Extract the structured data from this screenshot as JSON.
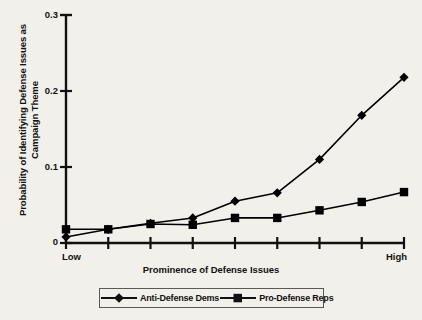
{
  "chart_data": {
    "type": "line",
    "title": "",
    "subtitle": "",
    "xlabel": "Prominence of Defense Issues",
    "ylabel": "Probability of Identifying Defense Issues as Campaign Theme",
    "ylabel_line1": "Probability of Identifying Defense Issues as",
    "ylabel_line2": "Campaign Theme",
    "x": [
      1,
      2,
      3,
      4,
      5,
      6,
      7,
      8,
      9
    ],
    "x_tick_labels": [
      "Low",
      "",
      "",
      "",
      "",
      "",
      "",
      "",
      "High"
    ],
    "x_axis_low_label": "Low",
    "x_axis_high_label": "High",
    "y_ticks": [
      0,
      0.1,
      0.2,
      0.3
    ],
    "y_tick_labels": [
      "0",
      "0.1",
      "0.2",
      "0.3"
    ],
    "ylim": [
      0,
      0.3
    ],
    "xlim": [
      1,
      9
    ],
    "grid": false,
    "legend_position": "bottom",
    "series": [
      {
        "name": "Anti-Defense Dems",
        "marker": "diamond",
        "color": "#000000",
        "values": [
          0.008,
          0.018,
          0.026,
          0.033,
          0.055,
          0.066,
          0.11,
          0.168,
          0.218
        ]
      },
      {
        "name": "Pro-Defense Reps",
        "marker": "square",
        "color": "#000000",
        "values": [
          0.018,
          0.018,
          0.025,
          0.024,
          0.033,
          0.033,
          0.043,
          0.054,
          0.067
        ]
      }
    ]
  },
  "legend": {
    "entries": [
      {
        "label": "Anti-Defense Dems",
        "marker": "diamond"
      },
      {
        "label": "Pro-Defense Reps",
        "marker": "square"
      }
    ]
  },
  "axes": {
    "y_label_0": "0",
    "y_label_1": "0.1",
    "y_label_2": "0.2",
    "y_label_3": "0.3",
    "x_low": "Low",
    "x_high": "High",
    "x_title": "Prominence of Defense Issues",
    "y_title_line1": "Probability of Identifying Defense Issues as",
    "y_title_line2": "Campaign Theme"
  }
}
